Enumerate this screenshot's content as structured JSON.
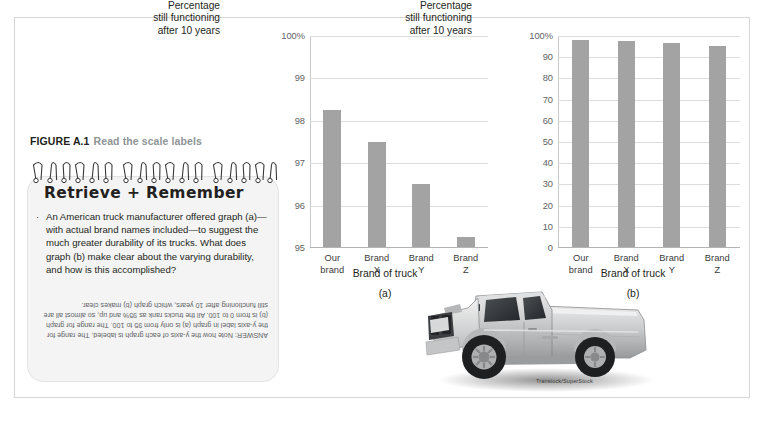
{
  "figure": {
    "number": "FIGURE A.1",
    "title": "Read the scale labels"
  },
  "notepad": {
    "heading": "Retrieve + Remember",
    "bullet_marker": "·",
    "question": "An American truck manufacturer offered graph (a)—with actual brand names included—to suggest the much greater durability of its trucks. What does graph (b) make clear about the varying durability, and how is this accomplished?",
    "answer": "ANSWER: Note how the y-axis of each graph is labeled. The range for the y-axis label in graph (a) is only from 95 to 100. The range for graph (b) is from 0 to 100. All the trucks rank as 95% and up, so almost all are still functioning after 10 years, which graph (b) makes clear."
  },
  "photo": {
    "credit": "Transtock/SuperStock",
    "alt": "silver pickup truck"
  },
  "colors": {
    "bar": "#a3a3a3",
    "grid": "#dcdcdc",
    "axis": "#b4b4b4",
    "text": "#231f20",
    "muted": "#5f6366",
    "caption_title": "#8e9496"
  },
  "chart_data": [
    {
      "id": "a",
      "type": "bar",
      "title": "",
      "panel_label": "(a)",
      "ylabel": "Percentage still functioning after 10 years",
      "ylabel_lines": [
        "Percentage",
        "still functioning",
        "after 10 years"
      ],
      "xlabel": "Brand of truck",
      "categories": [
        "Our brand",
        "Brand X",
        "Brand Y",
        "Brand Z"
      ],
      "category_lines": [
        [
          "Our",
          "brand"
        ],
        [
          "Brand",
          "X"
        ],
        [
          "Brand",
          "Y"
        ],
        [
          "Brand",
          "Z"
        ]
      ],
      "values": [
        98.25,
        97.5,
        96.5,
        95.25
      ],
      "ylim": [
        95,
        100
      ],
      "yticks": [
        95,
        96,
        97,
        98,
        99,
        100
      ],
      "ytick_labels": [
        "95",
        "96",
        "97",
        "98",
        "99",
        "100%"
      ],
      "grid": true,
      "legend": "none"
    },
    {
      "id": "b",
      "type": "bar",
      "title": "",
      "panel_label": "(b)",
      "ylabel": "Percentage still functioning after 10 years",
      "ylabel_lines": [
        "Percentage",
        "still functioning",
        "after 10 years"
      ],
      "xlabel": "Brand of truck",
      "categories": [
        "Our brand",
        "Brand X",
        "Brand Y",
        "Brand Z"
      ],
      "category_lines": [
        [
          "Our",
          "brand"
        ],
        [
          "Brand",
          "X"
        ],
        [
          "Brand",
          "Y"
        ],
        [
          "Brand",
          "Z"
        ]
      ],
      "values": [
        98.25,
        97.5,
        96.5,
        95.25
      ],
      "ylim": [
        0,
        100
      ],
      "yticks": [
        0,
        10,
        20,
        30,
        40,
        50,
        60,
        70,
        80,
        90,
        100
      ],
      "ytick_labels": [
        "0",
        "10",
        "20",
        "30",
        "40",
        "50",
        "60",
        "70",
        "80",
        "90",
        "100%"
      ],
      "grid": true,
      "legend": "none"
    }
  ]
}
